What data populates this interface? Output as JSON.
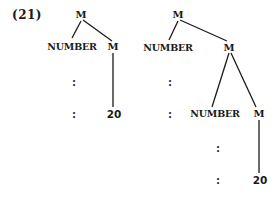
{
  "example_label": "(21)",
  "trees": [
    {
      "root": "M",
      "left_child": "NUMBER",
      "right_child": "M",
      "right_leaf": "20",
      "ellipsis": [
        ":",
        ":"
      ]
    },
    {
      "root": "M",
      "left_child": "NUMBER",
      "right_child": "M",
      "inner_left_child": "NUMBER",
      "inner_right_child": "M",
      "inner_right_leaf": "20",
      "outer_ellipsis": [
        ":",
        ":"
      ],
      "inner_ellipsis": [
        ":",
        ":"
      ]
    }
  ]
}
